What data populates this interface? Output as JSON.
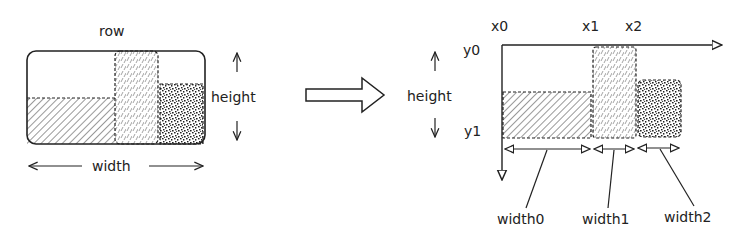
{
  "left_diagram": {
    "title": "row",
    "height_label": "height",
    "width_label": "width"
  },
  "transform_arrow": "hollow-right-arrow",
  "right_diagram": {
    "height_label": "height",
    "x_labels": [
      "x0",
      "x1",
      "x2"
    ],
    "y_labels": [
      "y0",
      "y1"
    ],
    "width_labels": [
      "width0",
      "width1",
      "width2"
    ]
  },
  "colors": {
    "ink": "#222222",
    "background": "#ffffff"
  }
}
